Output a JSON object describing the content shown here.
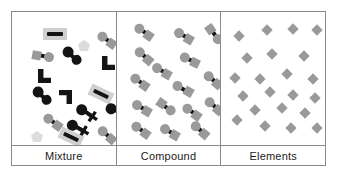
{
  "figure": {
    "title_row": {
      "labels": [
        {
          "text": "Mixture"
        },
        {
          "text": "Compound"
        },
        {
          "text": "Elements"
        }
      ]
    },
    "colors": {
      "frame": "#8a8a8a",
      "background": "#ffffff",
      "dark": "#141414",
      "gray": "#9a9a9a",
      "light_gray": "#cfcfcf",
      "pale_gray": "#dcdcdc",
      "text": "#1b1b1b"
    },
    "panels": [
      {
        "name": "mixture",
        "label": "Mixture",
        "description": "Mixture of several different substances: dark molecules, gray molecules, gray rectangles with dark bars, black L shapes, black plus-ended molecules and pale pentagons",
        "particles": [
          {
            "kind": "rect-bar",
            "x": 31,
            "y": 16,
            "rot": 0,
            "color": "dark",
            "plate": "light_gray"
          },
          {
            "kind": "pentagon",
            "x": 66,
            "y": 28,
            "rot": 0,
            "color": "pale_gray"
          },
          {
            "kind": "circle-bar-diamond",
            "x": 84,
            "y": 22,
            "rot": 35,
            "color": "gray"
          },
          {
            "kind": "diamond-bar-circle",
            "x": 20,
            "y": 38,
            "rot": 10,
            "color": "gray"
          },
          {
            "kind": "circle-bar-circle",
            "x": 49,
            "y": 38,
            "rot": 40,
            "color": "dark"
          },
          {
            "kind": "ell",
            "x": 90,
            "y": 44,
            "rot": 0,
            "color": "dark"
          },
          {
            "kind": "ell",
            "x": 26,
            "y": 57,
            "rot": 0,
            "color": "dark"
          },
          {
            "kind": "circle-bar-circle",
            "x": 19,
            "y": 78,
            "rot": 40,
            "color": "dark"
          },
          {
            "kind": "ell",
            "x": 47,
            "y": 78,
            "rot": 180,
            "color": "dark"
          },
          {
            "kind": "rect-bar",
            "x": 77,
            "y": 76,
            "rot": 25,
            "color": "dark",
            "plate": "light_gray"
          },
          {
            "kind": "cross-bar-circle",
            "x": 93,
            "y": 93,
            "rot": 25,
            "color": "dark"
          },
          {
            "kind": "cross-bar-circle",
            "x": 63,
            "y": 95,
            "rot": 35,
            "color": "dark"
          },
          {
            "kind": "circle-bar-diamond",
            "x": 30,
            "y": 104,
            "rot": 35,
            "color": "gray"
          },
          {
            "kind": "cross-bar-circle",
            "x": 54,
            "y": 110,
            "rot": 30,
            "color": "dark"
          },
          {
            "kind": "pentagon",
            "x": 19,
            "y": 119,
            "rot": 0,
            "color": "pale_gray"
          },
          {
            "kind": "rect-bar",
            "x": 47,
            "y": 119,
            "rot": 25,
            "color": "dark",
            "plate": "light_gray"
          },
          {
            "kind": "circle-bar-diamond",
            "x": 84,
            "y": 117,
            "rot": 40,
            "color": "gray"
          }
        ]
      },
      {
        "name": "compound",
        "label": "Compound",
        "description": "A single compound: identical two-atom molecules, a gray circle joined by a dark bond to a gray diamond",
        "particles": [
          {
            "kind": "circle-bar-diamond",
            "x": 16,
            "y": 14,
            "rot": 35
          },
          {
            "kind": "circle-bar-diamond",
            "x": 56,
            "y": 18,
            "rot": 30
          },
          {
            "kind": "diamond-bar-circle",
            "x": 86,
            "y": 16,
            "rot": 55
          },
          {
            "kind": "circle-bar-diamond",
            "x": 16,
            "y": 38,
            "rot": 40
          },
          {
            "kind": "circle-bar-diamond",
            "x": 62,
            "y": 42,
            "rot": 25
          },
          {
            "kind": "circle-bar-diamond",
            "x": 34,
            "y": 53,
            "rot": 30
          },
          {
            "kind": "circle-bar-diamond",
            "x": 12,
            "y": 64,
            "rot": 35
          },
          {
            "kind": "circle-bar-diamond",
            "x": 85,
            "y": 62,
            "rot": 40
          },
          {
            "kind": "diamond-bar-circle",
            "x": 55,
            "y": 70,
            "rot": 210
          },
          {
            "kind": "circle-bar-diamond",
            "x": 14,
            "y": 90,
            "rot": 30
          },
          {
            "kind": "circle-bar-diamond",
            "x": 38,
            "y": 88,
            "rot": 215
          },
          {
            "kind": "circle-bar-diamond",
            "x": 64,
            "y": 94,
            "rot": 35
          },
          {
            "kind": "circle-bar-diamond",
            "x": 86,
            "y": 88,
            "rot": 40
          },
          {
            "kind": "circle-bar-diamond",
            "x": 13,
            "y": 112,
            "rot": 35
          },
          {
            "kind": "circle-bar-diamond",
            "x": 42,
            "y": 114,
            "rot": 30
          },
          {
            "kind": "circle-bar-diamond",
            "x": 72,
            "y": 112,
            "rot": 40
          }
        ]
      },
      {
        "name": "elements",
        "label": "Elements",
        "description": "A single element: identical gray diamond atoms, unbonded",
        "particles": [
          {
            "kind": "diamond",
            "x": 14,
            "y": 20
          },
          {
            "kind": "diamond",
            "x": 42,
            "y": 14
          },
          {
            "kind": "diamond",
            "x": 68,
            "y": 13
          },
          {
            "kind": "diamond",
            "x": 92,
            "y": 14
          },
          {
            "kind": "diamond",
            "x": 22,
            "y": 42
          },
          {
            "kind": "diamond",
            "x": 47,
            "y": 38
          },
          {
            "kind": "diamond",
            "x": 79,
            "y": 40
          },
          {
            "kind": "diamond",
            "x": 10,
            "y": 62
          },
          {
            "kind": "diamond",
            "x": 35,
            "y": 63
          },
          {
            "kind": "diamond",
            "x": 62,
            "y": 58
          },
          {
            "kind": "diamond",
            "x": 88,
            "y": 63
          },
          {
            "kind": "diamond",
            "x": 18,
            "y": 80
          },
          {
            "kind": "diamond",
            "x": 45,
            "y": 76
          },
          {
            "kind": "diamond",
            "x": 68,
            "y": 79
          },
          {
            "kind": "diamond",
            "x": 90,
            "y": 82
          },
          {
            "kind": "diamond",
            "x": 30,
            "y": 94
          },
          {
            "kind": "diamond",
            "x": 57,
            "y": 92
          },
          {
            "kind": "diamond",
            "x": 80,
            "y": 97
          },
          {
            "kind": "diamond",
            "x": 12,
            "y": 104
          },
          {
            "kind": "diamond",
            "x": 40,
            "y": 110
          },
          {
            "kind": "diamond",
            "x": 66,
            "y": 112
          },
          {
            "kind": "diamond",
            "x": 92,
            "y": 112
          }
        ]
      }
    ]
  }
}
